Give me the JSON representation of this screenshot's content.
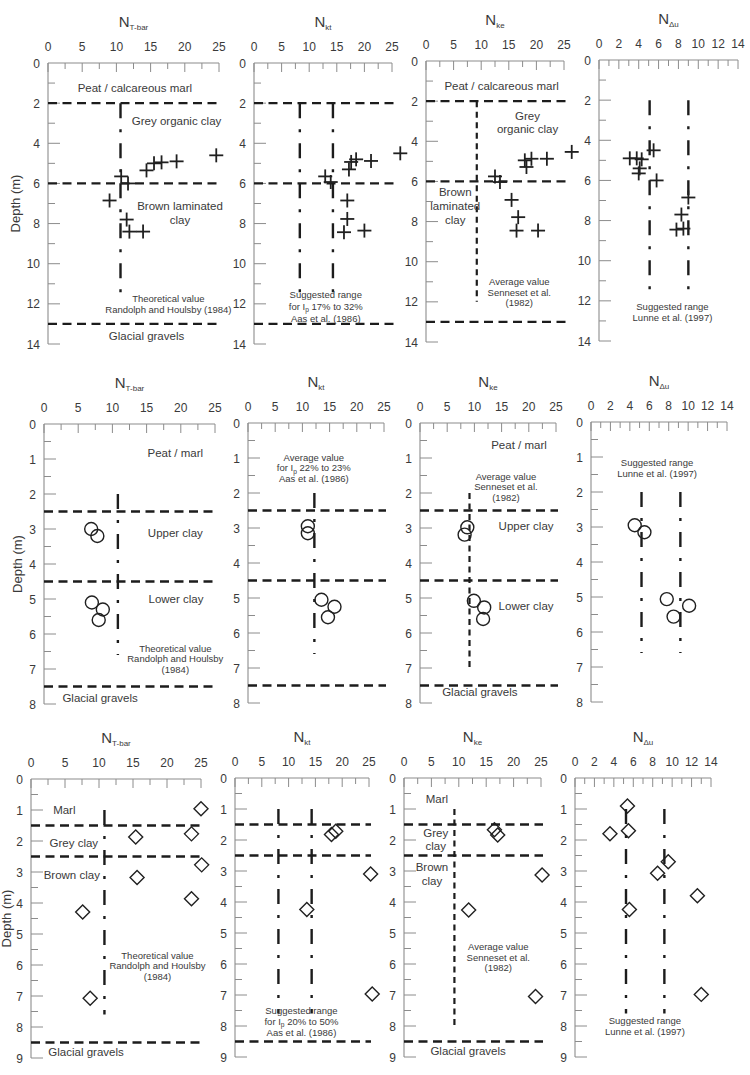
{
  "chart_data": [
    {
      "id": "row1-ntbar",
      "type": "scatter",
      "title": {
        "main": "N",
        "sub": "T-bar"
      },
      "ylabel": "Depth (m)",
      "xlim": [
        0,
        25
      ],
      "xticks": [
        0,
        5,
        10,
        15,
        20,
        25
      ],
      "xminor_step": 2.5,
      "ylim": [
        0,
        14
      ],
      "yticks": [
        0,
        2,
        4,
        6,
        8,
        10,
        12,
        14
      ],
      "yminor_step": 1,
      "y_inverted": true,
      "marker": "cross",
      "points": [
        [
          24.6,
          4.6
        ],
        [
          18.8,
          4.9
        ],
        [
          16.6,
          4.95
        ],
        [
          15.5,
          5.0
        ],
        [
          14.4,
          5.35
        ],
        [
          10.7,
          5.65
        ],
        [
          11.7,
          6.0
        ],
        [
          9.0,
          6.85
        ],
        [
          11.5,
          7.8
        ],
        [
          11.9,
          8.4
        ],
        [
          13.9,
          8.4
        ]
      ],
      "layer_boundaries": [
        2,
        6,
        13
      ],
      "reference_lines": [
        {
          "x": 10.6,
          "from_depth": 2,
          "to_depth": 11.6,
          "style": "dash-dot"
        }
      ],
      "annotations": [
        {
          "lines": [
            "Peat / calcareous marl"
          ]
        },
        {
          "lines": [
            "Grey organic clay"
          ]
        },
        {
          "lines": [
            "Brown laminated",
            "clay"
          ]
        },
        {
          "lines": [
            "Theoretical value",
            "Randolph and Houlsby (1984)"
          ]
        },
        {
          "lines": [
            "Glacial gravels"
          ]
        }
      ]
    },
    {
      "id": "row1-nkt",
      "type": "scatter",
      "title": {
        "main": "N",
        "sub": "kt"
      },
      "ylabel": "",
      "xlim": [
        0,
        25
      ],
      "xticks": [
        0,
        5,
        10,
        15,
        20,
        25
      ],
      "xminor_step": 2.5,
      "ylim": [
        0,
        14
      ],
      "yticks": [
        0,
        2,
        4,
        6,
        8,
        10,
        12,
        14
      ],
      "yminor_step": 1,
      "y_inverted": true,
      "marker": "cross",
      "points": [
        [
          26.5,
          4.5
        ],
        [
          21.2,
          4.88
        ],
        [
          18.5,
          4.8
        ],
        [
          17.6,
          4.93
        ],
        [
          17.2,
          5.3
        ],
        [
          12.9,
          5.65
        ],
        [
          13.9,
          5.93
        ],
        [
          16.9,
          6.85
        ],
        [
          16.9,
          7.77
        ],
        [
          16.3,
          8.43
        ],
        [
          20.0,
          8.35
        ]
      ],
      "layer_boundaries": [
        2,
        6,
        13
      ],
      "reference_lines": [
        {
          "x": 8.3,
          "from_depth": 2,
          "to_depth": 11.6,
          "style": "dash-dot"
        },
        {
          "x": 14.3,
          "from_depth": 2,
          "to_depth": 11.6,
          "style": "dash-dot"
        }
      ],
      "annotations": [
        {
          "lines": [
            "Suggested range",
            {
              "text": "for I",
              "sub": "p",
              "after": " 17% to 32%"
            },
            "Aas et al. (1986)"
          ]
        }
      ]
    },
    {
      "id": "row1-nke",
      "type": "scatter",
      "title": {
        "main": "N",
        "sub": "ke"
      },
      "ylabel": "",
      "xlim": [
        0,
        25
      ],
      "xticks": [
        0,
        5,
        10,
        15,
        20,
        25
      ],
      "xminor_step": 2.5,
      "ylim": [
        0,
        14
      ],
      "yticks": [
        0,
        2,
        4,
        6,
        8,
        10,
        12,
        14
      ],
      "yminor_step": 1,
      "y_inverted": true,
      "marker": "cross",
      "points": [
        [
          26.4,
          4.53
        ],
        [
          21.9,
          4.87
        ],
        [
          19.1,
          4.87
        ],
        [
          17.9,
          4.95
        ],
        [
          18.2,
          5.28
        ],
        [
          12.5,
          5.75
        ],
        [
          13.4,
          6.03
        ],
        [
          15.5,
          6.92
        ],
        [
          16.7,
          7.78
        ],
        [
          16.4,
          8.45
        ],
        [
          20.3,
          8.45
        ]
      ],
      "layer_boundaries": [
        2,
        6,
        13
      ],
      "reference_lines": [
        {
          "x": 9.2,
          "from_depth": 2,
          "to_depth": 12,
          "style": "dashed"
        }
      ],
      "annotations": [
        {
          "lines": [
            "Peat / calcareous marl"
          ]
        },
        {
          "lines": [
            "Grey",
            "organic clay"
          ]
        },
        {
          "lines": [
            "Brown",
            "laminated",
            "clay"
          ]
        },
        {
          "lines": [
            "Average value",
            "Senneset et al.",
            "(1982)"
          ]
        }
      ]
    },
    {
      "id": "row1-ndu",
      "type": "scatter",
      "title": {
        "main": "N",
        "sub": "Δu"
      },
      "ylabel": "",
      "xlim": [
        0,
        14
      ],
      "xticks": [
        0,
        2,
        4,
        6,
        8,
        10,
        12,
        14
      ],
      "xminor_step": 1,
      "ylim": [
        0,
        14
      ],
      "yticks": [
        0,
        2,
        4,
        6,
        8,
        10,
        12,
        14
      ],
      "yminor_step": 1,
      "y_inverted": true,
      "marker": "cross",
      "points": [
        [
          5.5,
          4.5
        ],
        [
          3.1,
          4.9
        ],
        [
          3.8,
          4.9
        ],
        [
          4.3,
          4.95
        ],
        [
          4.1,
          5.4
        ],
        [
          4.0,
          5.65
        ],
        [
          5.8,
          6.0
        ],
        [
          9.0,
          6.85
        ],
        [
          8.3,
          7.7
        ],
        [
          7.8,
          8.45
        ],
        [
          8.5,
          8.4
        ]
      ],
      "layer_boundaries": [],
      "reference_lines": [
        {
          "x": 5.1,
          "from_depth": 2,
          "to_depth": 11.6,
          "style": "dash-dot"
        },
        {
          "x": 9.0,
          "from_depth": 2,
          "to_depth": 11.6,
          "style": "dash-dot"
        }
      ],
      "annotations": [
        {
          "lines": [
            "Suggested range",
            "Lunne et al. (1997)"
          ]
        }
      ]
    },
    {
      "id": "row2-ntbar",
      "type": "scatter",
      "title": {
        "main": "N",
        "sub": "T-bar"
      },
      "ylabel": "Depth (m)",
      "xlim": [
        0,
        25
      ],
      "xticks": [
        0,
        5,
        10,
        15,
        20,
        25
      ],
      "xminor_step": 2.5,
      "ylim": [
        0,
        8
      ],
      "yticks": [
        0,
        1,
        2,
        3,
        4,
        5,
        6,
        7,
        8
      ],
      "yminor_step": 0.5,
      "y_inverted": true,
      "marker": "circle",
      "points": [
        [
          6.9,
          3.0
        ],
        [
          7.8,
          3.2
        ],
        [
          7.0,
          5.1
        ],
        [
          8.6,
          5.3
        ],
        [
          8.0,
          5.6
        ]
      ],
      "layer_boundaries": [
        2.5,
        4.5,
        7.5
      ],
      "reference_lines": [
        {
          "x": 10.8,
          "from_depth": 2,
          "to_depth": 6.6,
          "style": "dash-dot"
        }
      ],
      "annotations": [
        {
          "lines": [
            "Peat / marl"
          ]
        },
        {
          "lines": [
            "Upper clay"
          ]
        },
        {
          "lines": [
            "Lower clay"
          ]
        },
        {
          "lines": [
            "Theoretical value",
            "Randolph and Houlsby",
            "(1984)"
          ]
        },
        {
          "lines": [
            "Glacial gravels"
          ]
        }
      ]
    },
    {
      "id": "row2-nkt",
      "type": "scatter",
      "title": {
        "main": "N",
        "sub": "kt"
      },
      "ylabel": "",
      "xlim": [
        0,
        25
      ],
      "xticks": [
        0,
        5,
        10,
        15,
        20,
        25
      ],
      "xminor_step": 2.5,
      "ylim": [
        0,
        8
      ],
      "yticks": [
        0,
        1,
        2,
        3,
        4,
        5,
        6,
        7,
        8
      ],
      "yminor_step": 0.5,
      "y_inverted": true,
      "marker": "circle",
      "points": [
        [
          11.0,
          2.95
        ],
        [
          11.0,
          3.15
        ],
        [
          13.5,
          5.05
        ],
        [
          15.9,
          5.25
        ],
        [
          14.7,
          5.55
        ]
      ],
      "layer_boundaries": [
        2.5,
        4.5,
        7.5
      ],
      "reference_lines": [
        {
          "x": 12.2,
          "from_depth": 2,
          "to_depth": 6.6,
          "style": "dash-dot"
        }
      ],
      "annotations": [
        {
          "lines": [
            "Average value",
            {
              "text": "for I",
              "sub": "p",
              "after": " 22% to 23%"
            },
            "Aas et al. (1986)"
          ]
        }
      ]
    },
    {
      "id": "row2-nke",
      "type": "scatter",
      "title": {
        "main": "N",
        "sub": "ke"
      },
      "ylabel": "",
      "xlim": [
        0,
        25
      ],
      "xticks": [
        0,
        5,
        10,
        15,
        20,
        25
      ],
      "xminor_step": 2.5,
      "ylim": [
        0,
        8
      ],
      "yticks": [
        0,
        1,
        2,
        3,
        4,
        5,
        6,
        7,
        8
      ],
      "yminor_step": 0.5,
      "y_inverted": true,
      "marker": "circle",
      "points": [
        [
          8.7,
          2.98
        ],
        [
          8.2,
          3.19
        ],
        [
          9.9,
          5.08
        ],
        [
          11.8,
          5.27
        ],
        [
          11.6,
          5.6
        ]
      ],
      "layer_boundaries": [
        2.5,
        4.5,
        7.5
      ],
      "reference_lines": [
        {
          "x": 9.1,
          "from_depth": 2,
          "to_depth": 7,
          "style": "dashed"
        }
      ],
      "annotations": [
        {
          "lines": [
            "Peat / marl"
          ]
        },
        {
          "lines": [
            "Average value",
            "Senneset et al.",
            "(1982)"
          ]
        },
        {
          "lines": [
            "Upper clay"
          ]
        },
        {
          "lines": [
            "Lower clay"
          ]
        },
        {
          "lines": [
            "Glacial gravels"
          ]
        }
      ]
    },
    {
      "id": "row2-ndu",
      "type": "scatter",
      "title": {
        "main": "N",
        "sub": "Δu"
      },
      "ylabel": "",
      "xlim": [
        0,
        14
      ],
      "xticks": [
        0,
        2,
        4,
        6,
        8,
        10,
        12,
        14
      ],
      "xminor_step": 1,
      "ylim": [
        0,
        8
      ],
      "yticks": [
        0,
        1,
        2,
        3,
        4,
        5,
        6,
        7,
        8
      ],
      "yminor_step": 0.5,
      "y_inverted": true,
      "marker": "circle",
      "points": [
        [
          4.5,
          2.95
        ],
        [
          5.5,
          3.15
        ],
        [
          7.8,
          5.06
        ],
        [
          10.1,
          5.25
        ],
        [
          8.5,
          5.56
        ]
      ],
      "layer_boundaries": [],
      "reference_lines": [
        {
          "x": 5.2,
          "from_depth": 2,
          "to_depth": 6.6,
          "style": "dash-dot"
        },
        {
          "x": 9.2,
          "from_depth": 2,
          "to_depth": 6.6,
          "style": "dash-dot"
        }
      ],
      "annotations": [
        {
          "lines": [
            "Suggested range",
            "Lunne et al. (1997)"
          ]
        }
      ]
    },
    {
      "id": "row3-ntbar",
      "type": "scatter",
      "title": {
        "main": "N",
        "sub": "T-bar"
      },
      "ylabel": "Depth (m)",
      "xlim": [
        0,
        25
      ],
      "xticks": [
        0,
        5,
        10,
        15,
        20,
        25
      ],
      "xminor_step": 2.5,
      "ylim": [
        0,
        9
      ],
      "yticks": [
        0,
        1,
        2,
        3,
        4,
        5,
        6,
        7,
        8,
        9
      ],
      "yminor_step": 0.5,
      "y_inverted": true,
      "marker": "diamond",
      "points": [
        [
          25.0,
          0.96
        ],
        [
          15.4,
          1.87
        ],
        [
          23.6,
          1.77
        ],
        [
          25.1,
          2.77
        ],
        [
          15.6,
          3.18
        ],
        [
          23.6,
          3.86
        ],
        [
          7.6,
          4.29
        ],
        [
          8.7,
          7.07
        ]
      ],
      "layer_boundaries": [
        1.5,
        2.5,
        8.5
      ],
      "reference_lines": [
        {
          "x": 10.8,
          "from_depth": 1,
          "to_depth": 7.6,
          "style": "dash-dot"
        }
      ],
      "annotations": [
        {
          "lines": [
            "Marl"
          ]
        },
        {
          "lines": [
            "Grey clay"
          ]
        },
        {
          "lines": [
            "Brown clay"
          ]
        },
        {
          "lines": [
            "Theoretical value",
            "Randolph and Houlsby",
            "(1984)"
          ]
        },
        {
          "lines": [
            "Glacial gravels"
          ]
        }
      ]
    },
    {
      "id": "row3-nkt",
      "type": "scatter",
      "title": {
        "main": "N",
        "sub": "kt"
      },
      "ylabel": "",
      "xlim": [
        0,
        25
      ],
      "xticks": [
        0,
        5,
        10,
        15,
        20,
        25
      ],
      "xminor_step": 2.5,
      "ylim": [
        0,
        9
      ],
      "yticks": [
        0,
        1,
        2,
        3,
        4,
        5,
        6,
        7,
        8,
        9
      ],
      "yminor_step": 0.5,
      "y_inverted": true,
      "marker": "diamond",
      "points": [
        [
          18.8,
          1.72
        ],
        [
          18.0,
          1.82
        ],
        [
          25.3,
          3.1
        ],
        [
          13.4,
          4.24
        ],
        [
          25.6,
          6.97
        ]
      ],
      "layer_boundaries": [
        1.5,
        2.5,
        8.5
      ],
      "reference_lines": [
        {
          "x": 8.1,
          "from_depth": 1,
          "to_depth": 7.6,
          "style": "dash-dot"
        },
        {
          "x": 14.3,
          "from_depth": 1,
          "to_depth": 7.6,
          "style": "dash-dot"
        }
      ],
      "annotations": [
        {
          "lines": [
            "Suggested range",
            {
              "text": "for I",
              "sub": "p",
              "after": " 20% to 50%"
            },
            "Aas et al. (1986)"
          ]
        }
      ]
    },
    {
      "id": "row3-nke",
      "type": "scatter",
      "title": {
        "main": "N",
        "sub": "ke"
      },
      "ylabel": "",
      "xlim": [
        0,
        25
      ],
      "xticks": [
        0,
        5,
        10,
        15,
        20,
        25
      ],
      "xminor_step": 2.5,
      "ylim": [
        0,
        9
      ],
      "yticks": [
        0,
        1,
        2,
        3,
        4,
        5,
        6,
        7,
        8,
        9
      ],
      "yminor_step": 0.5,
      "y_inverted": true,
      "marker": "diamond",
      "points": [
        [
          16.5,
          1.67
        ],
        [
          17.1,
          1.84
        ],
        [
          25.2,
          3.13
        ],
        [
          11.8,
          4.26
        ],
        [
          24.0,
          7.05
        ]
      ],
      "layer_boundaries": [
        1.5,
        2.5,
        8.5
      ],
      "reference_lines": [
        {
          "x": 9.2,
          "from_depth": 1,
          "to_depth": 8,
          "style": "dashed"
        }
      ],
      "annotations": [
        {
          "lines": [
            "Marl"
          ]
        },
        {
          "lines": [
            "Grey",
            "clay"
          ]
        },
        {
          "lines": [
            "Brown",
            "clay"
          ]
        },
        {
          "lines": [
            "Average value",
            "Senneset et al.",
            "(1982)"
          ]
        },
        {
          "lines": [
            "Glacial gravels"
          ]
        }
      ]
    },
    {
      "id": "row3-ndu",
      "type": "scatter",
      "title": {
        "main": "N",
        "sub": "Δu"
      },
      "ylabel": "",
      "xlim": [
        0,
        14
      ],
      "xticks": [
        0,
        2,
        4,
        6,
        8,
        10,
        12,
        14
      ],
      "xminor_step": 1,
      "ylim": [
        0,
        9
      ],
      "yticks": [
        0,
        1,
        2,
        3,
        4,
        5,
        6,
        7,
        8,
        9
      ],
      "yminor_step": 0.5,
      "y_inverted": true,
      "marker": "diamond",
      "points": [
        [
          5.4,
          0.9
        ],
        [
          5.5,
          1.7
        ],
        [
          3.6,
          1.8
        ],
        [
          9.6,
          2.7
        ],
        [
          8.5,
          3.07
        ],
        [
          12.6,
          3.8
        ],
        [
          5.6,
          4.24
        ],
        [
          13.0,
          6.98
        ]
      ],
      "layer_boundaries": [],
      "reference_lines": [
        {
          "x": 5.25,
          "from_depth": 1,
          "to_depth": 7.6,
          "style": "dash-dot"
        },
        {
          "x": 9.2,
          "from_depth": 1,
          "to_depth": 7.6,
          "style": "dash-dot"
        }
      ],
      "annotations": [
        {
          "lines": [
            "Suggested range",
            "Lunne et al. (1997)"
          ]
        }
      ]
    }
  ]
}
